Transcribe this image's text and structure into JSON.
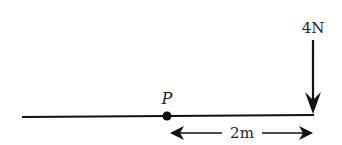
{
  "diagram": {
    "type": "force-diagram",
    "beam": {
      "description": "horizontal rod"
    },
    "point": {
      "label": "P"
    },
    "force": {
      "label": "4N",
      "direction": "down"
    },
    "dimension": {
      "label": "2m"
    },
    "colors": {
      "ink": "#111111",
      "background": "#ffffff"
    }
  }
}
